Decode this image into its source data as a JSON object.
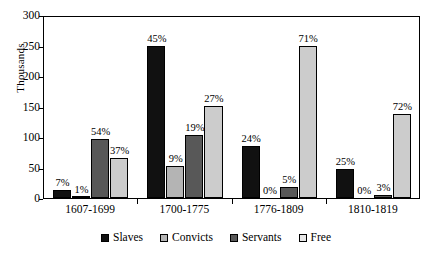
{
  "chart_data": {
    "type": "bar",
    "title": "",
    "xlabel": "",
    "ylabel": "Thousands",
    "ylim": [
      0,
      300
    ],
    "ytick_step": 50,
    "yticks": [
      "300",
      "250",
      "200",
      "150",
      "100",
      "50",
      "0"
    ],
    "grid": false,
    "legend_position": "bottom",
    "categories": [
      "1607-1699",
      "1700-1775",
      "1776-1809",
      "1810-1819"
    ],
    "series": [
      {
        "name": "Slaves",
        "color": "#111111",
        "values": [
          13,
          250,
          85,
          48
        ],
        "labels": [
          "7%",
          "45%",
          "24%",
          "25%"
        ]
      },
      {
        "name": "Convicts",
        "color": "#b4b4b4",
        "values": [
          2,
          52,
          0,
          0
        ],
        "labels": [
          "1%",
          "9%",
          "0%",
          "0%"
        ]
      },
      {
        "name": "Servants",
        "color": "#585858",
        "values": [
          97,
          104,
          18,
          5
        ],
        "labels": [
          "54%",
          "19%",
          "5%",
          "3%"
        ]
      },
      {
        "name": "Free",
        "color": "#cccccc",
        "values": [
          66,
          151,
          250,
          137
        ],
        "labels": [
          "37%",
          "27%",
          "71%",
          "72%"
        ]
      }
    ]
  }
}
